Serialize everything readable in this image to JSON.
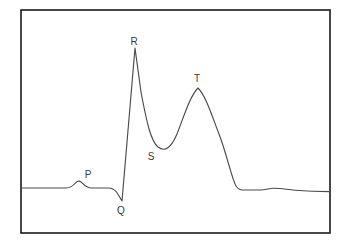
{
  "figure": {
    "background_color": "#ffffff",
    "frame_color": "#1a1a1a",
    "trace_color": "#4a4a4a",
    "label_color": "#3a3a3a"
  },
  "labels": {
    "p": "P",
    "q": "Q",
    "r": "R",
    "s": "S",
    "t": "T"
  },
  "chart_data": {
    "type": "line",
    "title": "",
    "xlabel": "",
    "ylabel": "",
    "grid": false,
    "legend": null,
    "axis_visible": false,
    "frame": {
      "x": 21,
      "y": 10,
      "width": 309,
      "height": 223
    },
    "xlim": [
      21,
      330
    ],
    "ylim": [
      10,
      233
    ],
    "baseline_y": 188,
    "annotations": [
      {
        "label": "P",
        "x": 88,
        "y": 175,
        "point_x": 80,
        "point_y": 181
      },
      {
        "label": "Q",
        "x": 121,
        "y": 211,
        "point_x": 122,
        "point_y": 201
      },
      {
        "label": "R",
        "x": 134,
        "y": 42,
        "point_x": 135,
        "point_y": 48
      },
      {
        "label": "S",
        "x": 151,
        "y": 157,
        "point_x": 158,
        "point_y": 147
      },
      {
        "label": "T",
        "x": 197,
        "y": 79,
        "point_x": 198,
        "point_y": 88
      }
    ],
    "path": "M21,188 L66,188 C70,188 73,186 76,182.5 C78,180.5 80,180.8 82,182.8 C85,186 88,188 92,188 L108,188 C112,188 114,188.6 116.5,192 C118.5,194.8 120,198 122,201 L135,48 L141,92 C147,124 151,141 158,147 C165,152.5 171,148 177,134 C184,116 190,96 198,88 C206,96 212,116 219,134 C227,155 231,176 236,186 C238,189.2 240,190 243,190 L260,190 C265,190 269,188.6 273,188.3 C279,188 286,189.4 295,190.2 C308,191.3 320,191.6 330,191.6",
    "segments": [
      {
        "name": "isoelectric-baseline-left",
        "x_start": 21,
        "x_end": 66,
        "y": 188
      },
      {
        "name": "p-wave",
        "x_start": 66,
        "x_end": 92,
        "peak_x": 80,
        "peak_y": 181,
        "amplitude_px": 7
      },
      {
        "name": "pr-segment",
        "x_start": 92,
        "x_end": 108,
        "y": 188
      },
      {
        "name": "q-downstroke",
        "x_start": 108,
        "x_end": 122,
        "trough_x": 122,
        "trough_y": 201
      },
      {
        "name": "r-upstroke",
        "x_start": 122,
        "x_end": 135,
        "peak_x": 135,
        "peak_y": 48,
        "amplitude_px": 140
      },
      {
        "name": "r-downstroke-to-s",
        "x_start": 135,
        "x_end": 158,
        "trough_x": 158,
        "trough_y": 147
      },
      {
        "name": "st-segment-rise",
        "x_start": 158,
        "x_end": 177,
        "y_end": 134
      },
      {
        "name": "t-wave",
        "x_start": 177,
        "x_end": 219,
        "peak_x": 198,
        "peak_y": 88,
        "amplitude_px": 100
      },
      {
        "name": "t-downstroke",
        "x_start": 219,
        "x_end": 243,
        "y_end": 190
      },
      {
        "name": "u-wave-baseline-right",
        "x_start": 243,
        "x_end": 330,
        "bump_x": 273,
        "bump_y": 188.3
      }
    ]
  }
}
